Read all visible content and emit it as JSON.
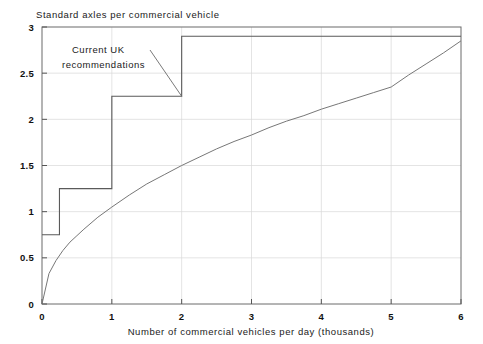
{
  "chart_data": {
    "type": "line",
    "title": "Standard axles per commercial vehicle",
    "xlabel": "Number of commercial vehicles per day (thousands)",
    "ylabel": "Standard axles per commercial vehicle",
    "xlim": [
      0,
      6
    ],
    "ylim": [
      0,
      3
    ],
    "grid": true,
    "legend_position": "none",
    "xticks": [
      0,
      1,
      2,
      3,
      4,
      5,
      6
    ],
    "xtick_labels": [
      "0",
      "1",
      "2",
      "3",
      "4",
      "5",
      "6"
    ],
    "yticks": [
      0,
      0.5,
      1,
      1.5,
      2,
      2.5,
      3
    ],
    "ytick_labels": [
      "0",
      "0.5",
      "1",
      "1.5",
      "2",
      "2.5",
      "3"
    ],
    "series": [
      {
        "name": "Current UK recommendations",
        "style": "step",
        "points": [
          {
            "x": 0,
            "y": 0.75
          },
          {
            "x": 0.25,
            "y": 0.75
          },
          {
            "x": 0.25,
            "y": 1.25
          },
          {
            "x": 1.0,
            "y": 1.25
          },
          {
            "x": 1.0,
            "y": 2.25
          },
          {
            "x": 2.0,
            "y": 2.25
          },
          {
            "x": 2.0,
            "y": 2.9
          },
          {
            "x": 6.0,
            "y": 2.9
          }
        ]
      },
      {
        "name": "Continuous relationship",
        "style": "curve",
        "points": [
          {
            "x": 0,
            "y": 0
          },
          {
            "x": 0.1,
            "y": 0.33
          },
          {
            "x": 0.2,
            "y": 0.47
          },
          {
            "x": 0.3,
            "y": 0.58
          },
          {
            "x": 0.4,
            "y": 0.67
          },
          {
            "x": 0.5,
            "y": 0.74
          },
          {
            "x": 0.6,
            "y": 0.81
          },
          {
            "x": 0.8,
            "y": 0.94
          },
          {
            "x": 1.0,
            "y": 1.05
          },
          {
            "x": 1.25,
            "y": 1.18
          },
          {
            "x": 1.5,
            "y": 1.3
          },
          {
            "x": 1.75,
            "y": 1.4
          },
          {
            "x": 2.0,
            "y": 1.5
          },
          {
            "x": 2.25,
            "y": 1.59
          },
          {
            "x": 2.5,
            "y": 1.68
          },
          {
            "x": 2.75,
            "y": 1.76
          },
          {
            "x": 3.0,
            "y": 1.83
          },
          {
            "x": 3.25,
            "y": 1.91
          },
          {
            "x": 3.5,
            "y": 1.98
          },
          {
            "x": 3.75,
            "y": 2.04
          },
          {
            "x": 4.0,
            "y": 2.11
          },
          {
            "x": 4.25,
            "y": 2.17
          },
          {
            "x": 4.5,
            "y": 2.23
          },
          {
            "x": 4.75,
            "y": 2.29
          },
          {
            "x": 5.0,
            "y": 2.35
          },
          {
            "x": 5.25,
            "y": 2.48
          },
          {
            "x": 5.5,
            "y": 2.6
          },
          {
            "x": 5.75,
            "y": 2.72
          },
          {
            "x": 6.0,
            "y": 2.85
          }
        ]
      }
    ],
    "annotations": [
      {
        "id": "uk-recommendations",
        "line1": "Current UK",
        "line2": "recommendations",
        "target_x": 2.0,
        "target_y": 2.25
      }
    ]
  },
  "axis": {
    "y_title": "Standard axles per commercial vehicle",
    "x_title": "Number of commercial vehicles per day (thousands)"
  }
}
